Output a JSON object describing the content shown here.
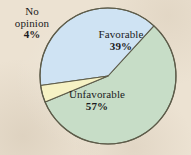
{
  "figure": {
    "background_color": "#ece2d2",
    "stroke_color": "#5d5c4a"
  },
  "chart_data": {
    "type": "pie",
    "title": "",
    "subtitle": "",
    "xlabel": "",
    "ylabel": "",
    "legend_position": "none",
    "grid": false,
    "total": 100,
    "units": "%",
    "start_angle_deg": 172,
    "direction": "clockwise",
    "categories": [
      "Favorable",
      "Unfavorable",
      "No opinion"
    ],
    "values": [
      39,
      57,
      4
    ],
    "colors": [
      "#cfe3f3",
      "#c7ddc7",
      "#f6f2c4"
    ],
    "slices": [
      {
        "label": "Favorable",
        "value": 39,
        "value_text": "39%",
        "color": "#cfe3f3",
        "label_position": "inside"
      },
      {
        "label": "Unfavorable",
        "value": 57,
        "value_text": "57%",
        "color": "#c7ddc7",
        "label_position": "inside"
      },
      {
        "label": "No opinion",
        "value": 4,
        "value_text": "4%",
        "color": "#f6f2c4",
        "label_position": "outside-left",
        "label_lines": [
          "No",
          "opinion"
        ]
      }
    ]
  },
  "labels": {
    "no_opinion": {
      "line1": "No",
      "line2": "opinion",
      "percent": "4%"
    },
    "favorable": {
      "name": "Favorable",
      "percent": "39%"
    },
    "unfavorable": {
      "name": "Unfavorable",
      "percent": "57%"
    }
  }
}
